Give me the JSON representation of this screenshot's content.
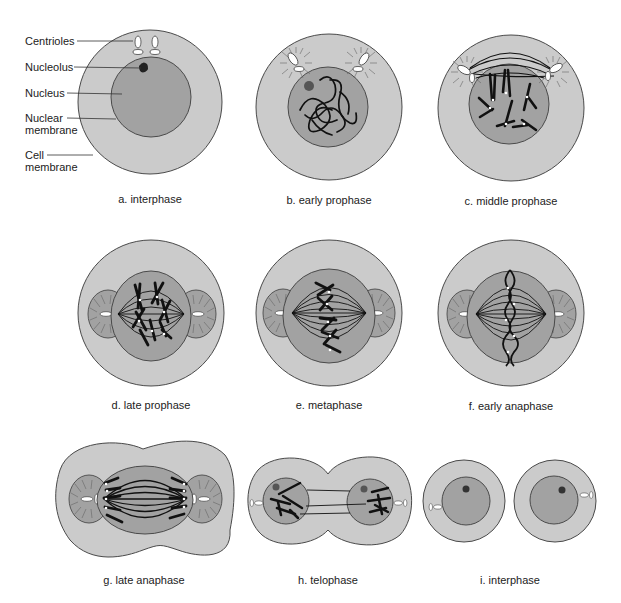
{
  "figure": {
    "colors": {
      "cytoplasm": "#cbcbcb",
      "nucleus": "#a2a2a2",
      "outline": "#4a4a4a",
      "chromosome": "#111111",
      "centriole": "#ffffff",
      "background": "#ffffff"
    }
  },
  "callouts": [
    {
      "text": "Centrioles",
      "line2": ""
    },
    {
      "text": "Nucleolus",
      "line2": ""
    },
    {
      "text": "Nucleus",
      "line2": ""
    },
    {
      "text": "Nuclear",
      "line2": "membrane"
    },
    {
      "text": "Cell",
      "line2": "membrane"
    }
  ],
  "stages": [
    {
      "id": "a",
      "caption": "a. interphase"
    },
    {
      "id": "b",
      "caption": "b. early prophase"
    },
    {
      "id": "c",
      "caption": "c. middle prophase"
    },
    {
      "id": "d",
      "caption": "d. late prophase"
    },
    {
      "id": "e",
      "caption": "e. metaphase"
    },
    {
      "id": "f",
      "caption": "f. early anaphase"
    },
    {
      "id": "g",
      "caption": "g. late anaphase"
    },
    {
      "id": "h",
      "caption": "h. telophase"
    },
    {
      "id": "i",
      "caption": "i. interphase"
    }
  ]
}
